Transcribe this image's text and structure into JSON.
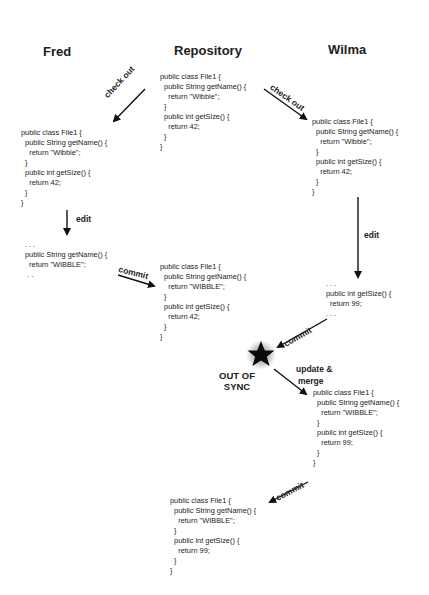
{
  "headers": {
    "fred": "Fred",
    "repository": "Repository",
    "wilma": "Wilma"
  },
  "code_blocks": {
    "repo_initial": "public class File1 {\n  public String getName() {\n    return \"Wibble\";\n  }\n  public int getSize() {\n    return 42;\n  }\n}",
    "fred_checkout": "public class File1 {\n  public String getName() {\n    return \"Wibble\";\n  }\n  public int getSize() {\n    return 42;\n  }\n}",
    "wilma_checkout": "public class File1 {\n  public String getName() {\n    return \"Wibble\";\n  }\n  public int getSize() {\n    return 42;\n  }\n}",
    "fred_edit": ". . .\npublic String getName() {\n  return \"WIBBLE\";\n . .",
    "repo_after_fred_commit": "public class File1 {\n  public String getName() {\n    return \"WIBBLE\";\n  }\n  public int getSize() {\n    return 42;\n  }\n}",
    "wilma_edit": ". . .\npublic int getSize() {\n  return 99;\n. . .",
    "wilma_merged": "public class File1 {\n  public String getName() {\n    return \"WIBBLE\";\n  }\n  public int getSize() {\n    return 99;\n  }\n}",
    "repo_final": "public class File1 {\n  public String getName() {\n    return \"WIBBLE\";\n  }\n  public int getSize() {\n    return 99;\n  }\n}"
  },
  "arrow_labels": {
    "fred_checkout": "check out",
    "wilma_checkout": "check out",
    "fred_edit": "edit",
    "fred_commit": "commit",
    "wilma_edit": "edit",
    "wilma_commit": "commit",
    "update_merge_line1": "update &",
    "update_merge_line2": "merge",
    "final_commit": "commit"
  },
  "conflict": {
    "line1": "OUT OF",
    "line2": "SYNC",
    "icon": "star-icon"
  },
  "colors": {
    "text": "#222222",
    "arrow": "#111111",
    "background": "#ffffff"
  }
}
